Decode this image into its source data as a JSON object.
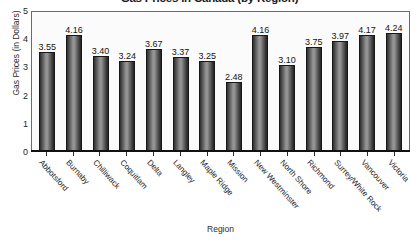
{
  "chart_data": {
    "type": "bar",
    "title": "Gas Prices in Canada (by Region)",
    "xlabel": "Region",
    "ylabel": "Gas Prices (in Dollars)",
    "ylim": [
      0,
      5
    ],
    "yticks": [
      "0",
      "1",
      "2",
      "3",
      "4",
      "5"
    ],
    "grid": false,
    "legend": "none",
    "value_labels": true,
    "categories": [
      "Abbotsford",
      "Burnaby",
      "Chilliwack",
      "Coquitlam",
      "Delta",
      "Langley",
      "Maple Ridge",
      "Mission",
      "New Westminster",
      "North Shore",
      "Richmond",
      "Surrey/White Rock",
      "Vancouver",
      "Victoria"
    ],
    "values": [
      3.55,
      4.16,
      3.4,
      3.24,
      3.67,
      3.37,
      3.25,
      2.48,
      4.16,
      3.1,
      3.75,
      3.97,
      4.17,
      4.24
    ],
    "value_text": [
      "3.55",
      "4.16",
      "3.40",
      "3.24",
      "3.67",
      "3.37",
      "3.25",
      "2.48",
      "4.16",
      "3.10",
      "3.75",
      "3.97",
      "4.17",
      "4.24"
    ]
  },
  "colors": {
    "bar_dark": "#232323",
    "bar_light": "#9a9a9a",
    "plot_background": "#fbfbfb",
    "axis": "#111111",
    "text": "#1e1e1e"
  }
}
